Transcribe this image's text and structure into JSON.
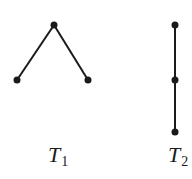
{
  "diagram": {
    "type": "trees",
    "trees": [
      {
        "name": "T1",
        "label_main": "T",
        "label_sub": "1",
        "shape": "path of 3 vertices drawn as inverted V",
        "nodes": [
          {
            "id": "a",
            "x": 54,
            "y": 25
          },
          {
            "id": "b",
            "x": 17,
            "y": 80
          },
          {
            "id": "c",
            "x": 88,
            "y": 80
          }
        ],
        "edges": [
          [
            "a",
            "b"
          ],
          [
            "a",
            "c"
          ]
        ]
      },
      {
        "name": "T2",
        "label_main": "T",
        "label_sub": "2",
        "shape": "path of 3 vertices drawn vertically",
        "nodes": [
          {
            "id": "d",
            "x": 175,
            "y": 25
          },
          {
            "id": "e",
            "x": 175,
            "y": 80
          },
          {
            "id": "f",
            "x": 175,
            "y": 132
          }
        ],
        "edges": [
          [
            "d",
            "e"
          ],
          [
            "e",
            "f"
          ]
        ]
      }
    ],
    "colors": {
      "line": "#1a1a1a",
      "node": "#1a1a1a",
      "background": "#ffffff"
    }
  }
}
